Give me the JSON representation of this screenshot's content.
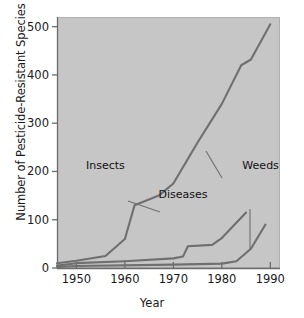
{
  "chart_data": {
    "type": "line",
    "title": "",
    "xlabel": "Year",
    "ylabel": "Number of Pesticide-Resistant Species",
    "xlim": [
      1946,
      1992
    ],
    "ylim": [
      0,
      520
    ],
    "xticks": [
      1950,
      1960,
      1970,
      1980,
      1990
    ],
    "xtick_labels": [
      "1950",
      "1960",
      "1970",
      "1980",
      "1990"
    ],
    "yticks": [
      0,
      100,
      200,
      300,
      400,
      500
    ],
    "ytick_labels": [
      "0",
      "100",
      "200",
      "300",
      "400",
      "500"
    ],
    "grid": false,
    "legend": "inline-annotations",
    "plot_background": "#c6c6c6",
    "line_color": "#6f6f6f",
    "series": [
      {
        "name": "Insects",
        "label": "Insects",
        "x": [
          1946,
          1950,
          1956,
          1960,
          1962,
          1967,
          1970,
          1975,
          1980,
          1984,
          1986,
          1990
        ],
        "values": [
          10,
          15,
          25,
          60,
          130,
          150,
          175,
          260,
          340,
          420,
          432,
          505
        ]
      },
      {
        "name": "Diseases",
        "label": "Diseases",
        "x": [
          1946,
          1950,
          1960,
          1970,
          1972,
          1973,
          1978,
          1980,
          1985
        ],
        "values": [
          5,
          10,
          14,
          20,
          24,
          45,
          48,
          62,
          115
        ]
      },
      {
        "name": "Weeds",
        "label": "Weeds",
        "x": [
          1946,
          1950,
          1970,
          1980,
          1983,
          1986,
          1989
        ],
        "values": [
          2,
          4,
          7,
          9,
          14,
          40,
          90
        ]
      }
    ],
    "annotations": [
      {
        "text": "Insects",
        "x": 1960,
        "y": 205
      },
      {
        "text": "Diseases",
        "x": 1972,
        "y": 145
      },
      {
        "text": "Weeds",
        "x": 1988,
        "y": 205
      }
    ]
  }
}
